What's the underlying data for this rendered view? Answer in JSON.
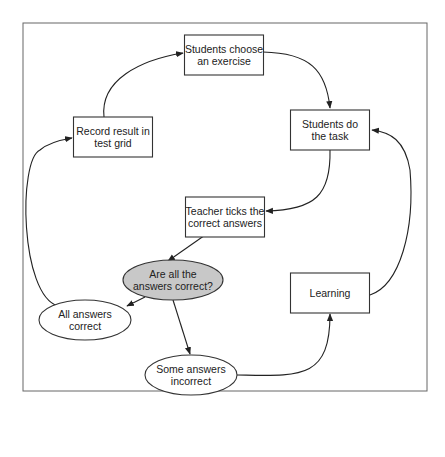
{
  "diagram": {
    "type": "flowchart-cycle",
    "colors": {
      "decision_fill": "#c8c8c8",
      "node_fill": "#ffffff",
      "stroke": "#333333"
    },
    "nodes": [
      {
        "id": "choose",
        "shape": "rect",
        "lines": [
          "Students choose",
          "an exercise"
        ]
      },
      {
        "id": "task",
        "shape": "rect",
        "lines": [
          "Students do",
          "the task"
        ]
      },
      {
        "id": "ticks",
        "shape": "rect",
        "lines": [
          "Teacher ticks the",
          "correct answers"
        ]
      },
      {
        "id": "decision",
        "shape": "ellipse",
        "lines": [
          "Are all the",
          "answers correct?"
        ]
      },
      {
        "id": "all",
        "shape": "ellipse",
        "lines": [
          "All answers",
          "correct"
        ]
      },
      {
        "id": "some",
        "shape": "ellipse",
        "lines": [
          "Some answers",
          "incorrect"
        ]
      },
      {
        "id": "learning",
        "shape": "rect",
        "lines": [
          "Learning"
        ]
      },
      {
        "id": "record",
        "shape": "rect",
        "lines": [
          "Record result in",
          "test grid"
        ]
      }
    ],
    "edges": [
      {
        "from": "choose",
        "to": "task"
      },
      {
        "from": "task",
        "to": "ticks"
      },
      {
        "from": "ticks",
        "to": "decision"
      },
      {
        "from": "decision",
        "to": "all"
      },
      {
        "from": "decision",
        "to": "some"
      },
      {
        "from": "some",
        "to": "learning"
      },
      {
        "from": "learning",
        "to": "task"
      },
      {
        "from": "all",
        "to": "record"
      },
      {
        "from": "record",
        "to": "choose"
      }
    ]
  }
}
